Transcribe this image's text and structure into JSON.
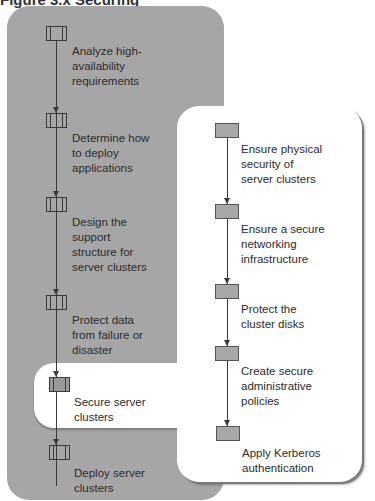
{
  "title": "Figure 3.x Securing",
  "main_flow": {
    "steps": [
      {
        "label": "Analyze high-\navailability\nrequirements",
        "active": false
      },
      {
        "label": "Determine how\nto deploy\napplications",
        "active": false
      },
      {
        "label": "Design the\nsupport\nstructure for\nserver clusters",
        "active": false
      },
      {
        "label": "Protect data\nfrom failure or\ndisaster",
        "active": false
      },
      {
        "label": "Secure server\nclusters",
        "active": true
      },
      {
        "label": "Deploy server\nclusters",
        "active": false
      }
    ]
  },
  "sub_flow": {
    "parent": "Secure server clusters",
    "steps": [
      {
        "label": "Ensure physical\nsecurity of\nserver clusters"
      },
      {
        "label": "Ensure a secure\nnetworking\ninfrastructure"
      },
      {
        "label": "Protect the\ncluster disks"
      },
      {
        "label": "Create secure\nadministrative\npolicies"
      },
      {
        "label": "Apply Kerberos\nauthentication"
      }
    ]
  },
  "colors": {
    "main_panel": "#a6a6a6",
    "sub_panel": "#ffffff",
    "sub_box_fill": "#a8a8a8",
    "line": "#3a3a3a"
  }
}
